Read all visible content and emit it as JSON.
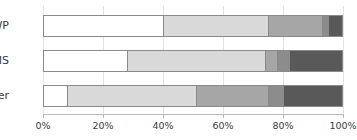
{
  "chart_data": {
    "type": "bar",
    "orientation": "horizontal",
    "stacked": true,
    "normalized_percent": true,
    "title": "",
    "subtitle": "",
    "xlabel": "",
    "ylabel": "",
    "categories": [
      "WP",
      "CMS",
      "Other"
    ],
    "xlim": [
      0,
      100
    ],
    "xticks": [
      0,
      20,
      40,
      60,
      80,
      100
    ],
    "xtick_labels": [
      "0%",
      "20%",
      "40%",
      "60%",
      "80%",
      "100%"
    ],
    "grid": true,
    "grid_axis": "x",
    "legend": false,
    "legend_position": "none",
    "series": [
      {
        "name": "Segment 1",
        "color": "#ffffff",
        "values": [
          40,
          28,
          8
        ]
      },
      {
        "name": "Segment 2",
        "color": "#d9d9d9",
        "values": [
          35,
          46,
          43
        ]
      },
      {
        "name": "Segment 3",
        "color": "#a6a6a6",
        "values": [
          18,
          4,
          24
        ]
      },
      {
        "name": "Segment 4",
        "color": "#8c8c8c",
        "values": [
          2,
          4,
          5
        ]
      },
      {
        "name": "Segment 5",
        "color": "#595959",
        "values": [
          5,
          18,
          20
        ]
      }
    ],
    "rows": [
      {
        "category": "WP",
        "segments": [
          {
            "value": 40,
            "start": 0,
            "end": 40,
            "color": "#ffffff"
          },
          {
            "value": 35,
            "start": 40,
            "end": 75,
            "color": "#d9d9d9"
          },
          {
            "value": 18,
            "start": 75,
            "end": 93,
            "color": "#a6a6a6"
          },
          {
            "value": 2,
            "start": 93,
            "end": 95,
            "color": "#8c8c8c"
          },
          {
            "value": 5,
            "start": 95,
            "end": 100,
            "color": "#595959"
          }
        ]
      },
      {
        "category": "CMS",
        "segments": [
          {
            "value": 28,
            "start": 0,
            "end": 28,
            "color": "#ffffff"
          },
          {
            "value": 46,
            "start": 28,
            "end": 74,
            "color": "#d9d9d9"
          },
          {
            "value": 4,
            "start": 74,
            "end": 78,
            "color": "#a6a6a6"
          },
          {
            "value": 4,
            "start": 78,
            "end": 82,
            "color": "#8c8c8c"
          },
          {
            "value": 18,
            "start": 82,
            "end": 100,
            "color": "#595959"
          }
        ]
      },
      {
        "category": "Other",
        "segments": [
          {
            "value": 8,
            "start": 0,
            "end": 8,
            "color": "#ffffff"
          },
          {
            "value": 43,
            "start": 8,
            "end": 51,
            "color": "#d9d9d9"
          },
          {
            "value": 24,
            "start": 51,
            "end": 75,
            "color": "#a6a6a6"
          },
          {
            "value": 5,
            "start": 75,
            "end": 80,
            "color": "#8c8c8c"
          },
          {
            "value": 20,
            "start": 80,
            "end": 100,
            "color": "#595959"
          }
        ]
      }
    ],
    "style": {
      "background": "#ffffff",
      "grid_color": "#e2e2e2",
      "axis_color": "#b8b8b8",
      "text_color": "#3a3a3a",
      "bar_border_color": "#8a8a8a"
    }
  }
}
